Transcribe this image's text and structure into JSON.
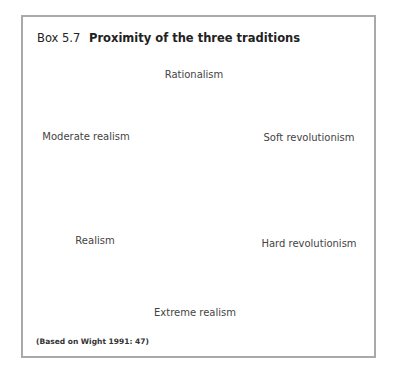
{
  "box": {
    "number": "Box 5.7",
    "title": "Proximity of the three traditions",
    "border_color": "#a9a9a9"
  },
  "diagram": {
    "type": "circle-of-traditions",
    "center": [
      194,
      190
    ],
    "radius": 120,
    "line_color": "#555555",
    "nodes": [
      {
        "label": "Rationalism",
        "position": "top"
      },
      {
        "label": "Soft revolutionism",
        "position": "upper-right"
      },
      {
        "label": "Hard revolutionism",
        "position": "lower-right"
      },
      {
        "label": "Extreme realism",
        "position": "bottom"
      },
      {
        "label": "Realism",
        "position": "lower-left"
      },
      {
        "label": "Moderate realism",
        "position": "upper-left"
      }
    ]
  },
  "caption": "(Based on Wight 1991: 47)"
}
